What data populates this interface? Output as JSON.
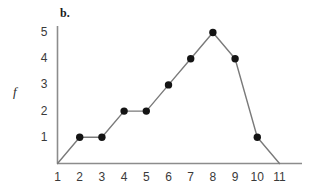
{
  "panel": {
    "label": "b."
  },
  "axes": {
    "y_title": "f",
    "y_ticks": [
      "1",
      "2",
      "3",
      "4",
      "5"
    ],
    "x_ticks": [
      "1",
      "2",
      "3",
      "4",
      "5",
      "6",
      "7",
      "8",
      "9",
      "10",
      "11"
    ]
  },
  "colors": {
    "axis": "#8c8c8c",
    "line": "#7a7a7a",
    "marker": "#141414",
    "text": "#3a3a3a",
    "background": "#ffffff"
  },
  "chart_data": {
    "type": "line",
    "title": "b.",
    "xlabel": "",
    "ylabel": "f",
    "x": [
      1,
      2,
      3,
      4,
      5,
      6,
      7,
      8,
      9,
      10,
      11
    ],
    "values": [
      0,
      1,
      1,
      2,
      2,
      3,
      4,
      5,
      4,
      1,
      0
    ],
    "markers_at_x": [
      2,
      3,
      4,
      5,
      6,
      7,
      8,
      9,
      10
    ],
    "xlim": [
      1,
      11
    ],
    "ylim": [
      0,
      5
    ],
    "xticks": [
      1,
      2,
      3,
      4,
      5,
      6,
      7,
      8,
      9,
      10,
      11
    ],
    "yticks": [
      1,
      2,
      3,
      4,
      5
    ],
    "grid": false,
    "legend": false,
    "marker_style": "filled-circle"
  }
}
